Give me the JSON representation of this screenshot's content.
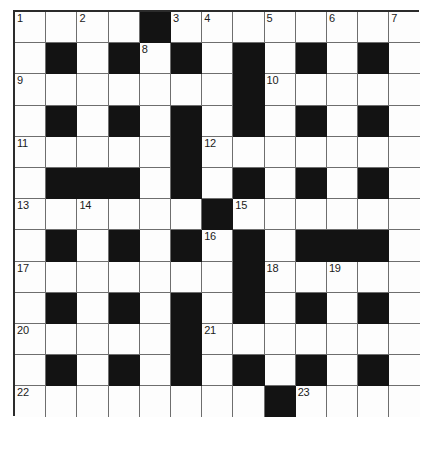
{
  "puzzle": {
    "kind": "crossword-grid",
    "title": "",
    "rows": 13,
    "columns": 13,
    "cell_size_px": 31.2,
    "colors": {
      "block": "#131313",
      "cell": "#fdfdfd",
      "grid_line": "#6e6e6e",
      "border": "#2b2b2b",
      "number_text": "#1a1a1a"
    },
    "legend": {
      "black_value": 1,
      "white_value": 0
    },
    "grid": [
      [
        0,
        0,
        0,
        0,
        1,
        0,
        0,
        0,
        0,
        0,
        0,
        0,
        0
      ],
      [
        0,
        1,
        0,
        1,
        0,
        1,
        0,
        1,
        0,
        1,
        0,
        1,
        0
      ],
      [
        0,
        0,
        0,
        0,
        0,
        0,
        0,
        1,
        0,
        0,
        0,
        0,
        0
      ],
      [
        0,
        1,
        0,
        1,
        0,
        1,
        0,
        1,
        0,
        1,
        0,
        1,
        0
      ],
      [
        0,
        0,
        0,
        0,
        0,
        1,
        0,
        0,
        0,
        0,
        0,
        0,
        0
      ],
      [
        0,
        1,
        1,
        1,
        0,
        1,
        0,
        1,
        0,
        1,
        0,
        1,
        0
      ],
      [
        0,
        0,
        0,
        0,
        0,
        0,
        1,
        0,
        0,
        0,
        0,
        0,
        0
      ],
      [
        0,
        1,
        0,
        1,
        0,
        1,
        0,
        1,
        0,
        1,
        1,
        1,
        0
      ],
      [
        0,
        0,
        0,
        0,
        0,
        0,
        0,
        1,
        0,
        0,
        0,
        0,
        0
      ],
      [
        0,
        1,
        0,
        1,
        0,
        1,
        0,
        1,
        0,
        1,
        0,
        1,
        0
      ],
      [
        0,
        0,
        0,
        0,
        0,
        1,
        0,
        0,
        0,
        0,
        0,
        0,
        0
      ],
      [
        0,
        1,
        0,
        1,
        0,
        1,
        0,
        1,
        0,
        1,
        0,
        1,
        0
      ],
      [
        0,
        0,
        0,
        0,
        0,
        0,
        0,
        0,
        1,
        0,
        0,
        0,
        0
      ]
    ],
    "numbers": [
      {
        "n": "1",
        "row": 0,
        "col": 0
      },
      {
        "n": "2",
        "row": 0,
        "col": 2
      },
      {
        "n": "3",
        "row": 0,
        "col": 5
      },
      {
        "n": "4",
        "row": 0,
        "col": 6
      },
      {
        "n": "5",
        "row": 0,
        "col": 8
      },
      {
        "n": "6",
        "row": 0,
        "col": 10
      },
      {
        "n": "7",
        "row": 0,
        "col": 12
      },
      {
        "n": "8",
        "row": 1,
        "col": 4
      },
      {
        "n": "9",
        "row": 2,
        "col": 0
      },
      {
        "n": "10",
        "row": 2,
        "col": 8
      },
      {
        "n": "11",
        "row": 4,
        "col": 0
      },
      {
        "n": "12",
        "row": 4,
        "col": 6
      },
      {
        "n": "13",
        "row": 6,
        "col": 0
      },
      {
        "n": "14",
        "row": 6,
        "col": 2
      },
      {
        "n": "15",
        "row": 6,
        "col": 7
      },
      {
        "n": "16",
        "row": 7,
        "col": 6
      },
      {
        "n": "17",
        "row": 8,
        "col": 0
      },
      {
        "n": "18",
        "row": 8,
        "col": 8
      },
      {
        "n": "19",
        "row": 8,
        "col": 10
      },
      {
        "n": "20",
        "row": 10,
        "col": 0
      },
      {
        "n": "21",
        "row": 10,
        "col": 6
      },
      {
        "n": "22",
        "row": 12,
        "col": 0
      },
      {
        "n": "23",
        "row": 12,
        "col": 9
      }
    ],
    "letters": []
  }
}
